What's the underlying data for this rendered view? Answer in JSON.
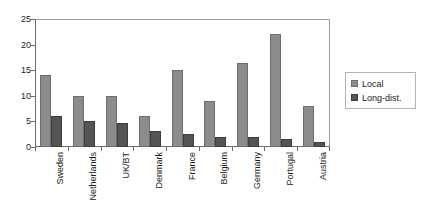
{
  "chart_data": {
    "type": "bar",
    "title": "",
    "subtitle": "",
    "xlabel": "",
    "ylabel": "",
    "ylim": [
      0,
      25
    ],
    "yticks": [
      0,
      5,
      10,
      15,
      20,
      25
    ],
    "ytick_labels": [
      "0",
      "5",
      "10",
      "15",
      "20",
      "25"
    ],
    "grid": false,
    "legend_position": "right",
    "categories": [
      "Sweden",
      "Netherlands",
      "UK/BT",
      "Denmark",
      "France",
      "Belgium",
      "Germany",
      "Portugal",
      "Austria"
    ],
    "series": [
      {
        "name": "Local",
        "color": "#8c8c8c",
        "values": [
          14,
          10,
          10,
          6,
          15,
          9,
          16.5,
          22,
          8
        ]
      },
      {
        "name": "Long-dist.",
        "color": "#545454",
        "values": [
          6,
          5,
          4.7,
          3.2,
          2.6,
          2,
          2,
          1.6,
          1
        ]
      }
    ]
  },
  "legend": {
    "items": [
      {
        "label": "Local"
      },
      {
        "label": "Long-dist."
      }
    ]
  },
  "colors": {
    "local": "#8c8c8c",
    "long_dist": "#545454",
    "axis": "#6b6b6b",
    "frame": "#9a9a9a",
    "text": "#1a1a1a",
    "background": "#ffffff"
  }
}
